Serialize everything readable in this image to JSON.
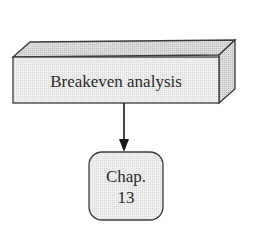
{
  "diagram": {
    "top_box": {
      "label": "Breakeven analysis",
      "shape": "3d-box"
    },
    "connector": {
      "type": "arrow",
      "direction": "down"
    },
    "bottom_box": {
      "line1": "Chap.",
      "line2": "13",
      "shape": "rounded-rectangle"
    }
  },
  "colors": {
    "stroke": "#3a3a3a",
    "front_fill": "#ececec",
    "top_fill": "#d6d6d6",
    "side_fill": "#c8c8c8",
    "rounded_fill": "#efefef"
  }
}
